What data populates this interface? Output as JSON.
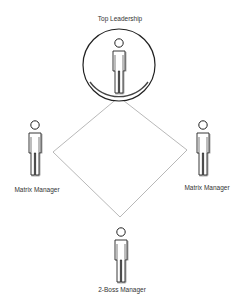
{
  "diagram": {
    "top": {
      "label": "Top Leadership",
      "icon": "person-icon"
    },
    "left": {
      "label": "Matrix Manager",
      "icon": "person-icon"
    },
    "right": {
      "label": "Matrix Manager",
      "icon": "person-icon"
    },
    "bottom": {
      "label": "2-Boss Manager",
      "icon": "person-icon"
    }
  },
  "colors": {
    "line": "#9a9a9a",
    "stroke": "#222222",
    "shadow": "#555555"
  }
}
